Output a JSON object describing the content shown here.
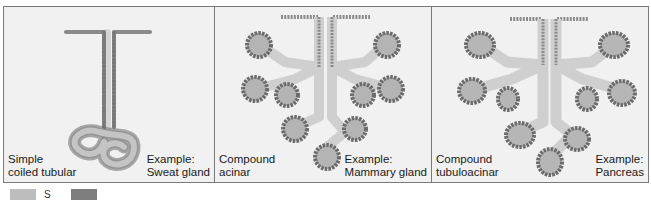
{
  "figure": {
    "panels": [
      {
        "type_label": "Simple\ncoiled tubular",
        "example_label": "Example:\nSweat gland"
      },
      {
        "type_label": "Compound\nacinar",
        "example_label": "Example:\nMammary gland"
      },
      {
        "type_label": "Compound\ntubuloacinar",
        "example_label": "Example:\nPancreas"
      }
    ]
  },
  "legend": {
    "items": [
      {
        "color": "#bdbdbd",
        "label": "S"
      },
      {
        "color": "#7d7d7d",
        "label": ""
      }
    ]
  },
  "colors": {
    "panel_bg": "#f1f1f1",
    "border": "#7a7a7a",
    "lumen": "#c8c8c8",
    "secretory": "#b0b0b0",
    "cell": "#8a8a8a",
    "cell_dark": "#555555"
  }
}
